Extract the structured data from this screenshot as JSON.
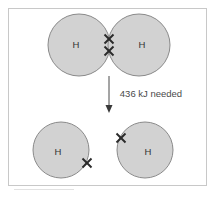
{
  "figure": {
    "background_color": "#ffffff",
    "frame_color": "#c8c8c8"
  },
  "colors": {
    "atom_fill": "#d2d2d2",
    "atom_stroke": "#8a8a8a",
    "electron_color": "#2b2b2b",
    "arrow_color": "#4a4a4a",
    "text_color": "#4a4a4a"
  },
  "top_stage": {
    "description": "Bonded hydrogen molecule H2 with shared electron pair",
    "atoms": [
      {
        "label": "H",
        "cx": 79,
        "cy": 45,
        "r": 31,
        "label_x": 76,
        "label_y": 45
      },
      {
        "label": "H",
        "cx": 139,
        "cy": 45,
        "r": 31,
        "label_x": 142,
        "label_y": 45
      }
    ],
    "electrons": [
      {
        "name": "shared-electron-upper",
        "x": 109,
        "y": 39,
        "size": 5
      },
      {
        "name": "shared-electron-lower",
        "x": 109,
        "y": 51,
        "size": 5
      }
    ]
  },
  "transition": {
    "energy_label": "436 kJ needed",
    "label_x": 151,
    "label_y": 94,
    "arrow": {
      "x": 109,
      "y_start": 76,
      "y_end": 113,
      "head_width": 7,
      "head_height": 7
    }
  },
  "bottom_stage": {
    "description": "Two separated hydrogen atoms each with one unpaired electron",
    "atoms": [
      {
        "label": "H",
        "cx": 61,
        "cy": 150,
        "r": 28,
        "label_x": 58,
        "label_y": 152
      },
      {
        "label": "H",
        "cx": 145,
        "cy": 150,
        "r": 28,
        "label_x": 148,
        "label_y": 152
      }
    ],
    "electrons": [
      {
        "name": "unpaired-electron-left-atom",
        "x": 87,
        "y": 163,
        "size": 5
      },
      {
        "name": "unpaired-electron-right-atom",
        "x": 121,
        "y": 138,
        "size": 5
      }
    ]
  }
}
